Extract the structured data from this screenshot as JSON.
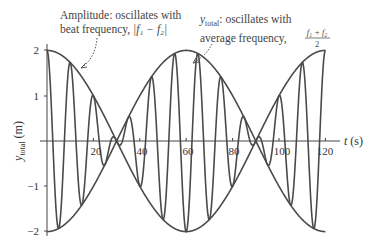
{
  "chart_data": {
    "type": "line",
    "title": "",
    "xlabel": "t (s)",
    "ylabel": "y_total (m)",
    "xlim": [
      0,
      120
    ],
    "ylim": [
      -2,
      2
    ],
    "x_ticks": [
      20,
      40,
      60,
      80,
      100,
      120
    ],
    "y_ticks": [
      2,
      1,
      -1,
      -2
    ],
    "grid": false,
    "legend": "none",
    "formula": "y = 2 cos(2*pi*t/120) * cos(2*pi*t/10)",
    "series": [
      {
        "name": "y_total",
        "amplitude": 2,
        "envelope_period_s": 120,
        "carrier_period_s": 10,
        "key_points": [
          [
            0,
            2
          ],
          [
            5,
            -1.93
          ],
          [
            10,
            1.73
          ],
          [
            15,
            -1.41
          ],
          [
            20,
            1.0
          ],
          [
            25,
            -0.52
          ],
          [
            30,
            0
          ],
          [
            35,
            -0.52
          ],
          [
            40,
            1.0
          ],
          [
            45,
            -1.41
          ],
          [
            50,
            1.73
          ],
          [
            55,
            -1.93
          ],
          [
            60,
            2
          ],
          [
            65,
            -1.93
          ],
          [
            70,
            1.73
          ],
          [
            75,
            -1.41
          ],
          [
            80,
            1.0
          ],
          [
            85,
            -0.52
          ],
          [
            90,
            0
          ],
          [
            95,
            -0.52
          ],
          [
            100,
            1.0
          ],
          [
            105,
            -1.41
          ],
          [
            110,
            1.73
          ],
          [
            115,
            -1.93
          ],
          [
            120,
            2
          ]
        ]
      },
      {
        "name": "envelope_upper",
        "formula": "2 cos(2*pi*t/120)"
      },
      {
        "name": "envelope_lower",
        "formula": "-2 cos(2*pi*t/120)"
      }
    ],
    "annotations": [
      {
        "text_line1": "Amplitude: oscillates with",
        "text_line2": "beat frequency, |f1 − f2|",
        "points_to": [
          10,
          1.73
        ]
      },
      {
        "text_line1": "y_total: oscillates with",
        "text_line2": "average frequency, (f1 + f2)/2",
        "points_to": [
          60,
          1.95
        ]
      }
    ]
  },
  "labels": {
    "x_axis_t": "t",
    "x_axis_unit": " (s)",
    "y_axis_main": "y",
    "y_axis_sub": "total",
    "y_axis_unit": " (m)",
    "ann1_line1": "Amplitude: oscillates with",
    "ann1_line2_pre": "beat frequency, ",
    "ann2_sym": "y",
    "ann2_sub": "total",
    "ann2_line1_rest": ": oscillates with",
    "ann2_line2_pre": "average frequency, ",
    "frac_num": "f₁ + f₂",
    "frac_den": "2",
    "abs_expr": "|f₁ − f₂|",
    "tick_x": [
      "20",
      "40",
      "60",
      "80",
      "100",
      "120"
    ],
    "tick_y": [
      "2",
      "1",
      "−1",
      "−2"
    ]
  }
}
